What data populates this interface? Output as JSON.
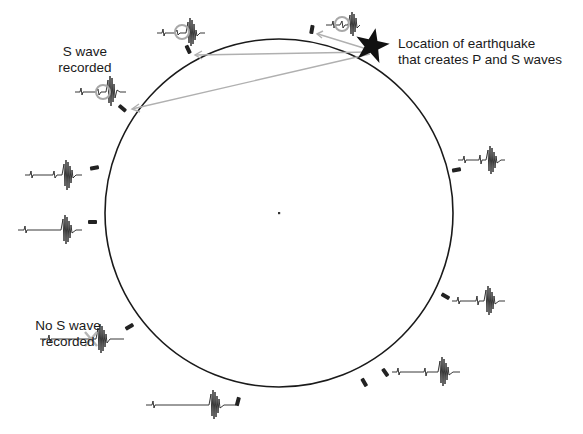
{
  "diagram": {
    "title": "",
    "labels": {
      "earthquake_line1": "Location of earthquake",
      "earthquake_line2": "that creates P and S waves",
      "s_recorded_line1": "S wave",
      "s_recorded_line2": "recorded",
      "no_s_line1": "No S wave",
      "no_s_line2": "recorded"
    },
    "colors": {
      "circle": "#1a1a1a",
      "ray": "#b0b0b0",
      "marker": "#a8a8a8",
      "trace": "#222222"
    },
    "earth": {
      "cx": 279,
      "cy": 213,
      "r": 174
    },
    "epicenter": {
      "x": 372,
      "y": 44,
      "symbol": "star"
    },
    "stations": [
      {
        "id": "top-right",
        "x": 313,
        "y": 42,
        "s_wave": "recorded"
      },
      {
        "id": "top-left",
        "x": 188,
        "y": 58,
        "s_wave": "recorded"
      },
      {
        "id": "upper-left",
        "x": 124,
        "y": 108,
        "s_wave": "recorded"
      },
      {
        "id": "left-upper",
        "x": 92,
        "y": 170,
        "s_wave": "recorded"
      },
      {
        "id": "left-lower",
        "x": 92,
        "y": 222,
        "s_wave": "recorded"
      },
      {
        "id": "lower-left",
        "x": 130,
        "y": 326,
        "s_wave": "not recorded"
      },
      {
        "id": "bottom",
        "x": 238,
        "y": 398,
        "s_wave": "recorded"
      },
      {
        "id": "bottom-right-1",
        "x": 364,
        "y": 376,
        "s_wave": "recorded"
      },
      {
        "id": "bottom-right-2",
        "x": 385,
        "y": 370,
        "s_wave": "recorded"
      },
      {
        "id": "right-lower",
        "x": 443,
        "y": 297,
        "s_wave": "recorded"
      },
      {
        "id": "right-upper",
        "x": 454,
        "y": 170,
        "s_wave": "recorded"
      }
    ],
    "center_dot": {
      "x": 279,
      "y": 213
    }
  }
}
